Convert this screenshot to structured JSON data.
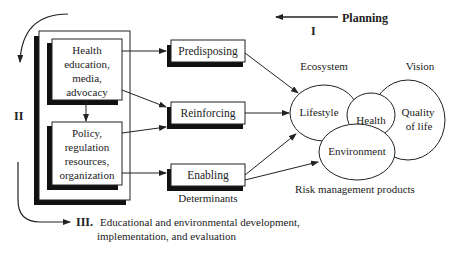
{
  "phases": {
    "planning": {
      "label": "Planning",
      "numeral": "I"
    },
    "implementation": {
      "numeral": "II"
    },
    "evaluation": {
      "numeral": "III.",
      "line1": "Educational and environmental development,",
      "line2": "implementation, and evaluation"
    }
  },
  "interventions": {
    "health_box": [
      "Health",
      "education,",
      "media,",
      "advocacy"
    ],
    "policy_box": [
      "Policy,",
      "regulation",
      "resources,",
      "organization"
    ]
  },
  "determinants": {
    "caption": "Determinants",
    "items": [
      "Predisposing",
      "Reinforcing",
      "Enabling"
    ]
  },
  "outcomes": {
    "ecosystem_label": "Ecosystem",
    "vision_label": "Vision",
    "lifestyle": "Lifestyle",
    "health": "Health",
    "quality_line1": "Quality",
    "quality_line2": "of life",
    "environment": "Environment",
    "caption": "Risk management products"
  },
  "colors": {
    "ink": "#222222",
    "shadow": "#111111",
    "background": "#ffffff"
  }
}
